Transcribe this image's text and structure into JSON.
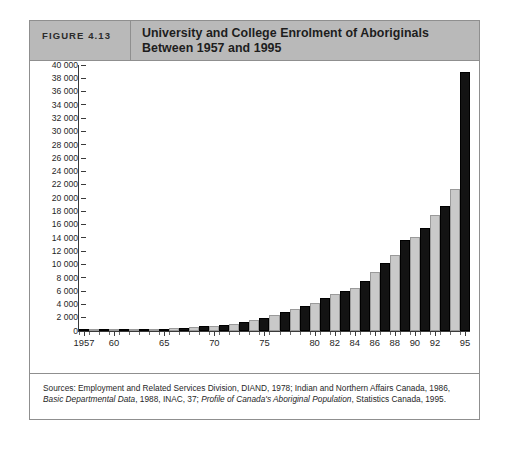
{
  "figure": {
    "number_label": "FIGURE 4.13",
    "title": "University and College Enrolment of Aboriginals Between 1957 and 1995",
    "source_prefix": "Sources: Employment and Related Services Division, DIAND, 1978; Indian and Northern Affairs Canada, 1986,",
    "source_italic_1": "Basic Departmental Data",
    "source_mid": ", 1988, INAC, 37; ",
    "source_italic_2": "Profile of Canada's Aboriginal Population",
    "source_suffix": ", Statistics Canada, 1995."
  },
  "colors": {
    "header_background": "#b9b9b9",
    "frame_border": "#8f8f8f",
    "bar_dark": "#131313",
    "bar_light": "#c9c9c9",
    "axis": "#3a3a3a",
    "page_background": "#ffffff"
  },
  "chart_data": {
    "type": "bar",
    "title": "University and College Enrolment of Aboriginals Between 1957 and 1995",
    "xlabel": "",
    "ylabel": "",
    "ylim": [
      0,
      40000
    ],
    "grid": false,
    "legend": "none",
    "y_ticks": [
      0,
      2000,
      4000,
      6000,
      8000,
      10000,
      12000,
      14000,
      16000,
      18000,
      20000,
      22000,
      24000,
      26000,
      28000,
      30000,
      32000,
      34000,
      36000,
      38000,
      40000
    ],
    "y_tick_labels": [
      "0",
      "2 000",
      "4 000",
      "6 000",
      "8 000",
      "10 000",
      "12 000",
      "14 000",
      "16 000",
      "18 000",
      "20 000",
      "22 000",
      "24 000",
      "26 000",
      "28 000",
      "30 000",
      "32 000",
      "34 000",
      "36 000",
      "38 000",
      "40 000"
    ],
    "x_tick_labels": [
      "1957",
      "60",
      "65",
      "70",
      "75",
      "80",
      "82",
      "84",
      "86",
      "88",
      "90",
      "92",
      "95"
    ],
    "x_tick_years": [
      1957,
      1960,
      1965,
      1970,
      1975,
      1980,
      1982,
      1984,
      1986,
      1988,
      1990,
      1992,
      1995
    ],
    "categories": [
      1957,
      1958,
      1959,
      1960,
      1961,
      1962,
      1963,
      1964,
      1965,
      1966,
      1967,
      1968,
      1969,
      1970,
      1971,
      1972,
      1973,
      1974,
      1975,
      1976,
      1977,
      1978,
      1979,
      1980,
      1981,
      1982,
      1983,
      1984,
      1985,
      1986,
      1987,
      1988,
      1989,
      1990,
      1991,
      1992,
      1993,
      1994,
      1995
    ],
    "values": [
      60,
      80,
      100,
      120,
      150,
      200,
      250,
      300,
      350,
      420,
      500,
      600,
      700,
      800,
      900,
      1100,
      1300,
      1600,
      2000,
      2400,
      2800,
      3300,
      3800,
      4200,
      5000,
      5500,
      6000,
      6500,
      7500,
      8800,
      10200,
      11500,
      13700,
      14100,
      15500,
      17400,
      18800,
      21300,
      39000
    ]
  }
}
